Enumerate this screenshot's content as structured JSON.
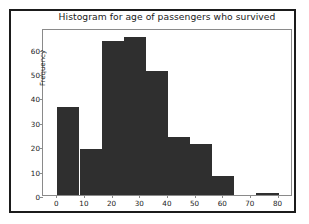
{
  "figure": {
    "background_color": "#ffffff",
    "frame_color": "#1b1b1b",
    "axes_color": "#8a8a8a",
    "bar_color": "#2f2f2f"
  },
  "chart_data": {
    "type": "bar",
    "title": "Histogram for age of passengers who survived",
    "xlabel": "",
    "ylabel": "Frequency",
    "xlim": [
      -4.8,
      85.6
    ],
    "ylim": [
      0,
      68.5
    ],
    "grid": false,
    "legend": null,
    "bin_edges": [
      0.4,
      8.4,
      16.4,
      24.4,
      32.4,
      40.4,
      48.4,
      56.4,
      64.4,
      72.4,
      80.4
    ],
    "categories": [
      "0.4-8.4",
      "8.4-16.4",
      "16.4-24.4",
      "24.4-32.4",
      "32.4-40.4",
      "40.4-48.4",
      "48.4-56.4",
      "56.4-64.4",
      "64.4-72.4",
      "72.4-80.4"
    ],
    "values": [
      36,
      19,
      63,
      65,
      51,
      24,
      21,
      8,
      0,
      1
    ],
    "xticks": [
      0,
      10,
      20,
      30,
      40,
      50,
      60,
      70,
      80
    ],
    "xticklabels": [
      "0",
      "10",
      "20",
      "30",
      "40",
      "50",
      "60",
      "70",
      "80"
    ],
    "yticks": [
      0,
      10,
      20,
      30,
      40,
      50,
      60
    ],
    "yticklabels": [
      "0",
      "10",
      "20",
      "30",
      "40",
      "50",
      "60"
    ]
  }
}
